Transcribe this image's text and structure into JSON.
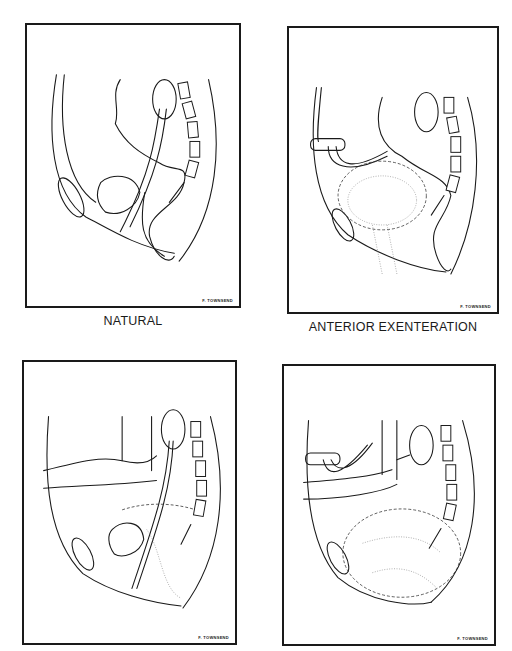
{
  "figure": {
    "panels": [
      {
        "id": "natural",
        "caption": "NATURAL",
        "signature": "F. TOWNSEND"
      },
      {
        "id": "anterior-exenteration",
        "caption": "ANTERIOR EXENTERATION",
        "signature": "F. TOWNSEND"
      },
      {
        "id": "posterior-view-3",
        "caption": "",
        "signature": "F. TOWNSEND"
      },
      {
        "id": "total-exenteration-4",
        "caption": "",
        "signature": "F. TOWNSEND"
      }
    ]
  },
  "colors": {
    "ink": "#1a1a1a",
    "background": "#ffffff"
  }
}
